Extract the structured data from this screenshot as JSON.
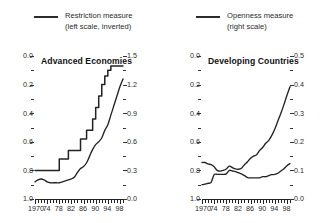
{
  "legend": {
    "items": [
      {
        "name": "restriction",
        "label_line1": "Restriction measure",
        "label_line2": "(left scale, inverted)",
        "color": "#2b2b2b"
      },
      {
        "name": "openness",
        "label_line1": "Openness measure",
        "label_line2": "(right scale)",
        "color": "#2b2b2b"
      }
    ]
  },
  "chart_data": [
    {
      "type": "line",
      "title": "Advanced Economies",
      "xlabel": "",
      "ylabel": "",
      "grid": false,
      "legend_position": "top",
      "x": [
        1970,
        1971,
        1972,
        1973,
        1974,
        1975,
        1976,
        1977,
        1978,
        1979,
        1980,
        1981,
        1982,
        1983,
        1984,
        1985,
        1986,
        1987,
        1988,
        1989,
        1990,
        1991,
        1992,
        1993,
        1994,
        1995,
        1996,
        1997,
        1998,
        1999
      ],
      "xlim": [
        1970,
        1999
      ],
      "xticks": [
        "1970",
        "74",
        "78",
        "82",
        "86",
        "90",
        "94",
        "98"
      ],
      "xtick_values": [
        1970,
        1974,
        1978,
        1982,
        1986,
        1990,
        1994,
        1998
      ],
      "left_axis": {
        "label": "Restriction measure (left scale, inverted)",
        "ticks": [
          "0.0",
          "0.2",
          "0.4",
          "0.6",
          "0.8",
          "1.0"
        ],
        "tick_values": [
          0.0,
          0.2,
          0.4,
          0.6,
          0.8,
          1.0
        ],
        "lim": [
          0.0,
          1.0
        ],
        "inverted": true
      },
      "right_axis": {
        "label": "Openness measure (right scale)",
        "ticks": [
          "1.5",
          "1.2",
          "0.9",
          "0.6",
          "0.3",
          "0.0"
        ],
        "tick_values": [
          1.5,
          1.2,
          0.9,
          0.6,
          0.3,
          0.0
        ],
        "lim": [
          0.0,
          1.5
        ]
      },
      "series": [
        {
          "name": "Restriction measure",
          "axis": "left",
          "style": "step",
          "values": [
            0.8,
            0.8,
            0.8,
            0.8,
            0.8,
            0.8,
            0.8,
            0.8,
            0.72,
            0.72,
            0.72,
            0.66,
            0.66,
            0.66,
            0.66,
            0.58,
            0.58,
            0.52,
            0.52,
            0.44,
            0.36,
            0.28,
            0.2,
            0.14,
            0.1,
            0.07,
            0.07,
            0.07,
            0.07,
            0.07
          ]
        },
        {
          "name": "Openness measure",
          "axis": "right",
          "style": "smooth",
          "values": [
            0.18,
            0.2,
            0.21,
            0.2,
            0.18,
            0.17,
            0.17,
            0.17,
            0.17,
            0.18,
            0.19,
            0.2,
            0.21,
            0.23,
            0.28,
            0.32,
            0.34,
            0.38,
            0.45,
            0.52,
            0.57,
            0.6,
            0.64,
            0.72,
            0.78,
            0.88,
            0.98,
            1.08,
            1.18,
            1.26
          ]
        }
      ]
    },
    {
      "type": "line",
      "title": "Developing Countries",
      "xlabel": "",
      "ylabel": "",
      "grid": false,
      "legend_position": "top",
      "x": [
        1970,
        1971,
        1972,
        1973,
        1974,
        1975,
        1976,
        1977,
        1978,
        1979,
        1980,
        1981,
        1982,
        1983,
        1984,
        1985,
        1986,
        1987,
        1988,
        1989,
        1990,
        1991,
        1992,
        1993,
        1994,
        1995,
        1996,
        1997,
        1998,
        1999
      ],
      "xlim": [
        1970,
        1999
      ],
      "xticks": [
        "1970",
        "74",
        "78",
        "82",
        "86",
        "90",
        "94",
        "98"
      ],
      "xtick_values": [
        1970,
        1974,
        1978,
        1982,
        1986,
        1990,
        1994,
        1998
      ],
      "left_axis": {
        "label": "Restriction measure (left scale, inverted)",
        "ticks": [
          "0.0",
          "0.2",
          "0.4",
          "0.6",
          "0.8",
          "1.0"
        ],
        "tick_values": [
          0.0,
          0.2,
          0.4,
          0.6,
          0.8,
          1.0
        ],
        "lim": [
          0.0,
          1.0
        ],
        "inverted": true
      },
      "right_axis": {
        "label": "Openness measure (right scale)",
        "ticks": [
          "0.5",
          "0.4",
          "0.3",
          "0.2",
          "0.1",
          "0.0"
        ],
        "tick_values": [
          0.5,
          0.4,
          0.3,
          0.2,
          0.1,
          0.0
        ],
        "lim": [
          0.0,
          0.5
        ]
      },
      "series": [
        {
          "name": "Restriction measure",
          "axis": "left",
          "style": "smooth",
          "values": [
            0.745,
            0.745,
            0.755,
            0.76,
            0.775,
            0.8,
            0.805,
            0.8,
            0.79,
            0.77,
            0.78,
            0.79,
            0.792,
            0.785,
            0.76,
            0.74,
            0.715,
            0.7,
            0.69,
            0.66,
            0.64,
            0.61,
            0.59,
            0.555,
            0.51,
            0.455,
            0.4,
            0.34,
            0.275,
            0.215
          ]
        },
        {
          "name": "Openness measure",
          "axis": "right",
          "style": "smooth",
          "values": [
            0.05,
            0.052,
            0.055,
            0.058,
            0.085,
            0.086,
            0.086,
            0.086,
            0.088,
            0.1,
            0.098,
            0.096,
            0.092,
            0.088,
            0.082,
            0.075,
            0.074,
            0.074,
            0.074,
            0.074,
            0.078,
            0.078,
            0.082,
            0.085,
            0.086,
            0.09,
            0.098,
            0.106,
            0.116,
            0.124
          ]
        }
      ]
    }
  ]
}
